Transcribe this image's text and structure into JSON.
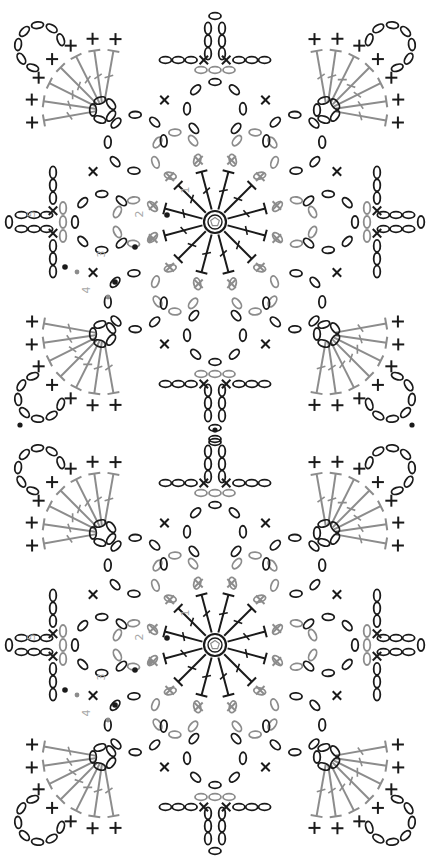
{
  "diagram": {
    "type": "crochet-stitch-chart",
    "colors": {
      "black": "#1a1a1a",
      "gray": "#8c8c8c",
      "label": "#a8a8a8",
      "background": "#ffffff"
    },
    "legend_symbols": {
      "chain": "oval",
      "single_crochet": "cross",
      "double_crochet": "T-bar with slash",
      "slip_stitch": "dot",
      "magic_ring": "circle with pentagon"
    },
    "motifs": [
      {
        "id": "motif-top",
        "center": [
          215,
          222
        ]
      },
      {
        "id": "motif-bottom",
        "center": [
          215,
          645
        ]
      }
    ],
    "round_labels": [
      {
        "text": "1",
        "dx": 26,
        "dy": 32
      },
      {
        "text": "2",
        "dx": 72,
        "dy": 8
      },
      {
        "text": "3",
        "dx": 110,
        "dy": -32
      },
      {
        "text": "4",
        "dx": 125,
        "dy": -68
      },
      {
        "text": "5",
        "dx": 180,
        "dy": 8
      }
    ],
    "joins": [
      {
        "x": 215,
        "y": 430
      },
      {
        "x": 20,
        "y": 425
      },
      {
        "x": 412,
        "y": 425
      }
    ],
    "side_caption": ""
  }
}
